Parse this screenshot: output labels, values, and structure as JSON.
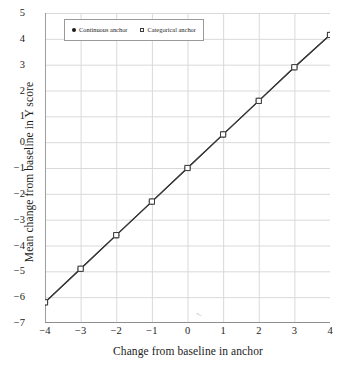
{
  "chart_data": {
    "type": "line",
    "title": "",
    "xlabel": "Change from baseline in anchor",
    "ylabel": "Mean change from baseline in Y score",
    "x": [
      -4,
      -3,
      -2,
      -1,
      0,
      1,
      2,
      3,
      4
    ],
    "xlim": [
      -4,
      4
    ],
    "ylim": [
      -7,
      5
    ],
    "xticks": [
      "−4",
      "−3",
      "−2",
      "−1",
      "0",
      "1",
      "2",
      "3",
      "4"
    ],
    "yticks": [
      "5",
      "4",
      "3",
      "2",
      "1",
      "0",
      "−1",
      "−2",
      "−3",
      "−4",
      "−5",
      "−6",
      "−7"
    ],
    "grid": true,
    "legend_position": "upper left inside",
    "series": [
      {
        "name": "Continuous anchor",
        "marker": "filled-circle",
        "color": "#1b1b1b",
        "values": [
          -6.2,
          -4.9,
          -3.6,
          -2.3,
          -1.0,
          0.3,
          1.6,
          2.9,
          4.15
        ]
      },
      {
        "name": "Categorical anchor",
        "marker": "hollow-square",
        "color": "#3a3a3a",
        "values": [
          -6.2,
          -4.9,
          -3.6,
          -2.3,
          -1.0,
          0.3,
          1.6,
          2.9,
          4.15
        ]
      }
    ]
  },
  "legend": {
    "entries": [
      {
        "label": "Continuous anchor"
      },
      {
        "label": "Categorical anchor"
      }
    ]
  },
  "axes": {
    "x_title": "Change from baseline in anchor",
    "y_title": "Mean change from baseline in Y score"
  },
  "artifact": {
    "cursor_glyph": "↖"
  }
}
